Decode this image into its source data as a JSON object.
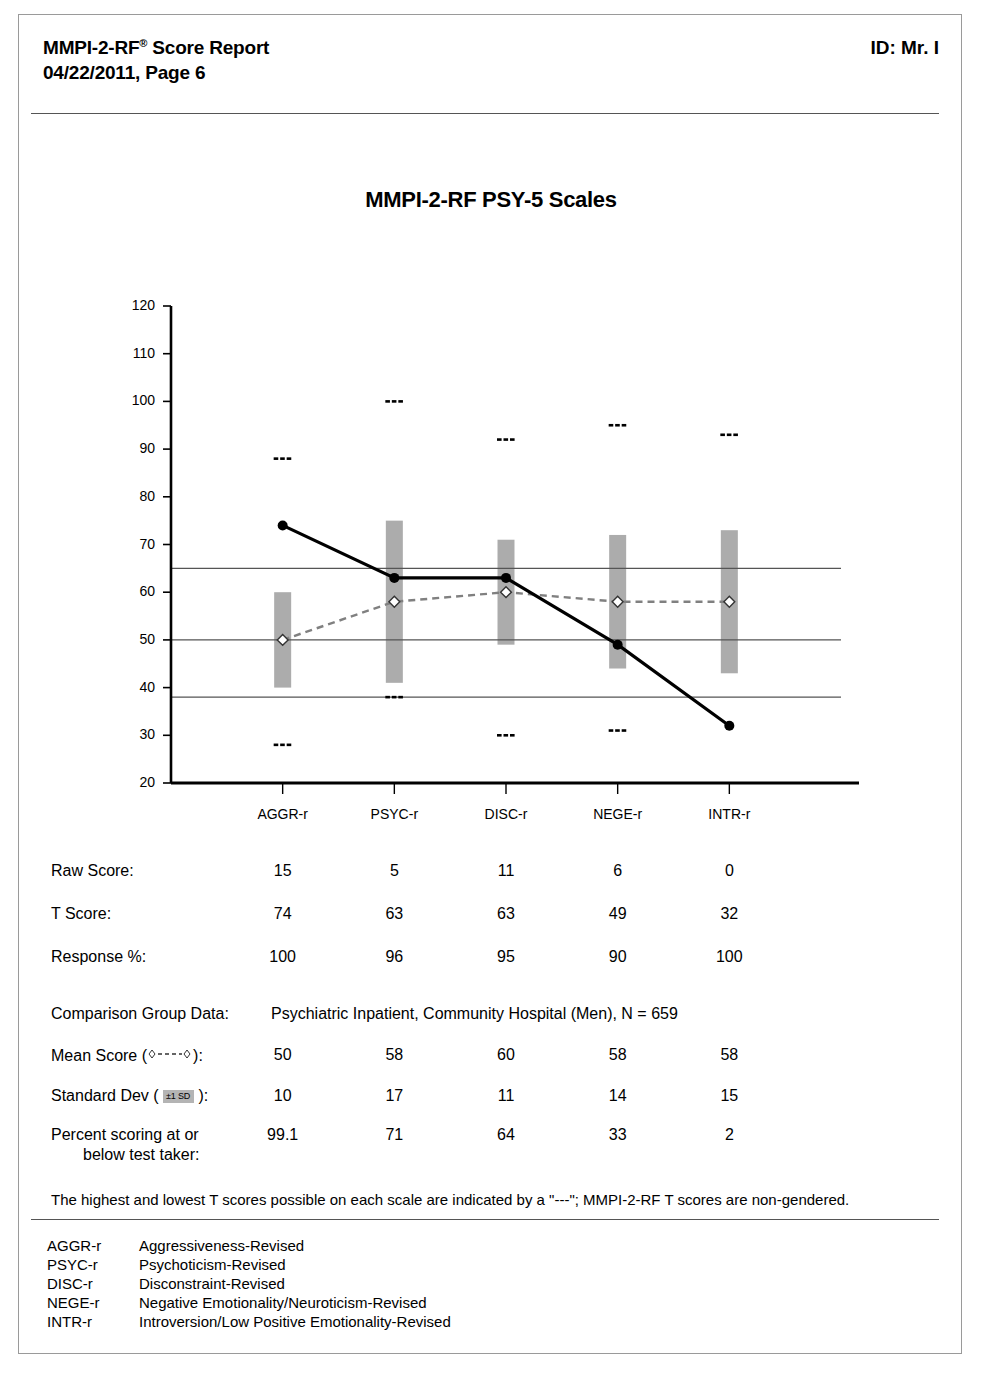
{
  "header": {
    "title": "MMPI-2-RF",
    "title_sup": "®",
    "title_rest": " Score Report",
    "subtitle": "04/22/2011, Page 6",
    "id_label": "ID: Mr. I"
  },
  "chart_title": "MMPI-2-RF PSY-5 Scales",
  "chart_data": {
    "type": "line",
    "title": "MMPI-2-RF PSY-5 Scales",
    "xlabel": "",
    "ylabel": "",
    "ylim": [
      20,
      120
    ],
    "yticks": [
      20,
      30,
      40,
      50,
      60,
      70,
      80,
      90,
      100,
      110,
      120
    ],
    "grid": false,
    "reference_lines": [
      65,
      50,
      38
    ],
    "legend": "none",
    "categories": [
      "AGGR-r",
      "PSYC-r",
      "DISC-r",
      "NEGE-r",
      "INTR-r"
    ],
    "series": [
      {
        "name": "T Score",
        "marker": "filled-circle",
        "line": "solid",
        "values": [
          74,
          63,
          63,
          49,
          32
        ]
      },
      {
        "name": "Mean Score",
        "marker": "open-diamond",
        "line": "dashed",
        "values": [
          50,
          58,
          60,
          58,
          58
        ]
      }
    ],
    "sd_bars": {
      "name": "±1 SD band",
      "lower": [
        40,
        41,
        49,
        44,
        43
      ],
      "upper": [
        60,
        75,
        71,
        72,
        73
      ]
    },
    "max_markers": [
      88,
      100,
      92,
      95,
      93
    ],
    "min_markers": [
      28,
      38,
      30,
      31,
      20
    ],
    "marker_glyph": "---"
  },
  "table": {
    "columns": [
      "AGGR-r",
      "PSYC-r",
      "DISC-r",
      "NEGE-r",
      "INTR-r"
    ],
    "rows": [
      {
        "label": "Raw Score:",
        "values": [
          "15",
          "5",
          "11",
          "6",
          "0"
        ]
      },
      {
        "label": "T Score:",
        "values": [
          "74",
          "63",
          "63",
          "49",
          "32"
        ]
      },
      {
        "label": "Response %:",
        "values": [
          "100",
          "96",
          "95",
          "90",
          "100"
        ]
      }
    ]
  },
  "comparison": {
    "group_label": "Comparison Group Data:",
    "group_value": "Psychiatric Inpatient, Community Hospital (Men), N = 659",
    "mean_label_pre": "Mean Score  (",
    "mean_label_post": "):",
    "sd_label_pre": "Standard Dev (",
    "sd_badge": "±1 SD",
    "sd_label_post": "):",
    "percent_label_line1": "Percent scoring at or",
    "percent_label_line2": "below test taker:",
    "mean_values": [
      "50",
      "58",
      "60",
      "58",
      "58"
    ],
    "sd_values": [
      "10",
      "17",
      "11",
      "14",
      "15"
    ],
    "percent_values": [
      "99.1",
      "71",
      "64",
      "33",
      "2"
    ]
  },
  "footnote": "The highest and lowest T scores possible on each scale are indicated by a \"---\"; MMPI-2-RF T scores are non-gendered.",
  "abbreviations": [
    {
      "code": "AGGR-r",
      "name": "Aggressiveness-Revised"
    },
    {
      "code": "PSYC-r",
      "name": "Psychoticism-Revised"
    },
    {
      "code": "DISC-r",
      "name": "Disconstraint-Revised"
    },
    {
      "code": "NEGE-r",
      "name": "Negative Emotionality/Neuroticism-Revised"
    },
    {
      "code": "INTR-r",
      "name": "Introversion/Low Positive Emotionality-Revised"
    }
  ],
  "colors": {
    "sd_bar": "#a8a8a8",
    "t_line": "#000000",
    "mean_line": "#808080",
    "reference_line": "#555555",
    "page_border": "#9a9a9a"
  }
}
